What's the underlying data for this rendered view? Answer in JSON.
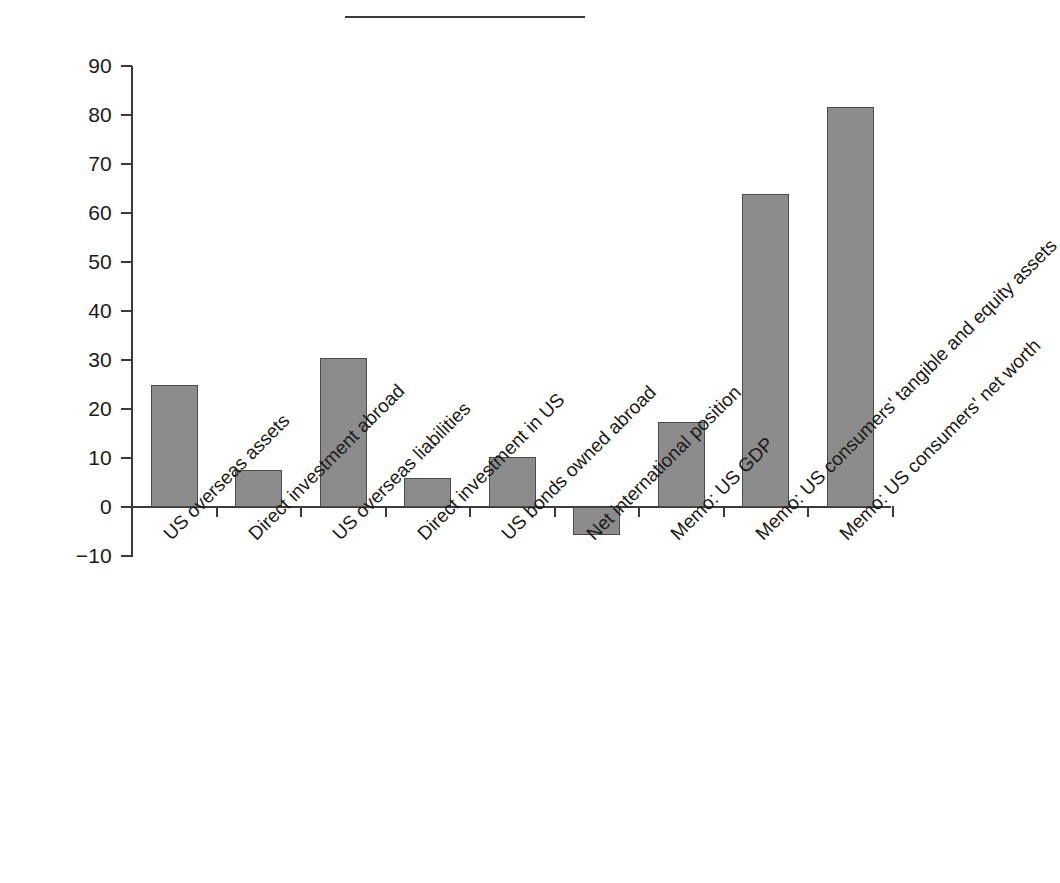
{
  "figure": {
    "has_top_rule": true,
    "background_color": "#ffffff",
    "bar_fill_color": "#8c8c8c",
    "bar_edge_color": "#4a4a4a",
    "axis_color": "#3b3b3b"
  },
  "chart_data": {
    "type": "bar",
    "title": "",
    "xlabel": "",
    "ylabel": "",
    "ylim": [
      -10,
      90
    ],
    "yticks": [
      -10,
      0,
      10,
      20,
      30,
      40,
      50,
      60,
      70,
      80,
      90
    ],
    "ytick_labels": [
      "−10",
      "0",
      "10",
      "20",
      "30",
      "40",
      "50",
      "60",
      "70",
      "80",
      "90"
    ],
    "grid": false,
    "legend": false,
    "categories": [
      "US overseas assets",
      "Direct investment abroad",
      "US overseas liabilities",
      "Direct investment in US",
      "US bonds owned abroad",
      "Net international position",
      "Memo: US GDP",
      "Memo: US consumers' tangible and equity assets",
      "Memo: US consumers' net worth"
    ],
    "values": [
      25.0,
      7.5,
      30.5,
      5.9,
      10.2,
      -5.8,
      17.4,
      63.8,
      81.7
    ]
  }
}
